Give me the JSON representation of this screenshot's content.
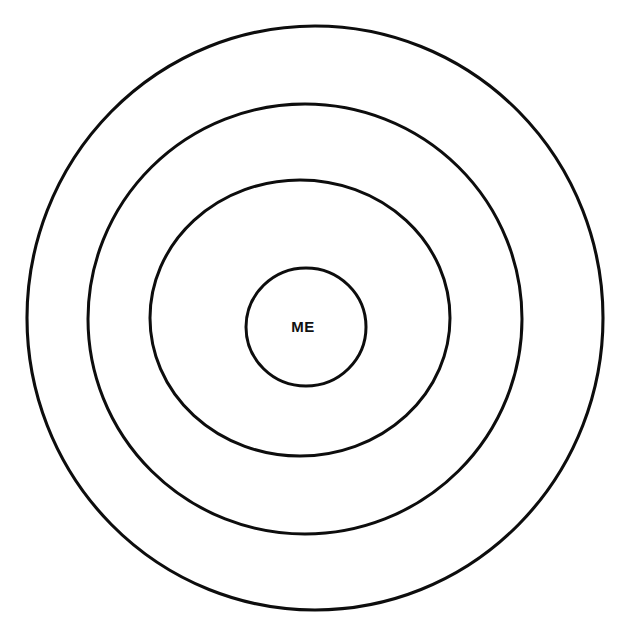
{
  "diagram": {
    "background_color": "#ffffff",
    "stroke_color": "#0d0d0d",
    "stroke_width": 3,
    "center_label": "ME",
    "center_label_color": "#111111",
    "ring_count": 4,
    "rings": [
      {
        "name": "outer-ring",
        "index": 1,
        "label": "",
        "center_x": 315,
        "center_y": 318,
        "radius_x": 288,
        "radius_y": 292
      },
      {
        "name": "second-ring",
        "index": 2,
        "label": "",
        "center_x": 305,
        "center_y": 319,
        "radius_x": 217,
        "radius_y": 215
      },
      {
        "name": "third-ring",
        "index": 3,
        "label": "",
        "center_x": 300,
        "center_y": 318,
        "radius_x": 150,
        "radius_y": 138
      },
      {
        "name": "core-circle",
        "index": 4,
        "label": "ME",
        "center_x": 306,
        "center_y": 327,
        "radius_x": 60,
        "radius_y": 59
      }
    ]
  },
  "chart_data": {
    "type": "diagram",
    "subtype": "concentric-circles",
    "title": "",
    "categories": [
      "outer-ring",
      "second-ring",
      "third-ring",
      "core-circle"
    ],
    "values": [
      288,
      217,
      150,
      60
    ],
    "labels": [
      "",
      "",
      "",
      "ME"
    ],
    "xlabel": "",
    "ylabel": "",
    "legend": [],
    "annotations": [
      "ME"
    ],
    "grid": false
  }
}
